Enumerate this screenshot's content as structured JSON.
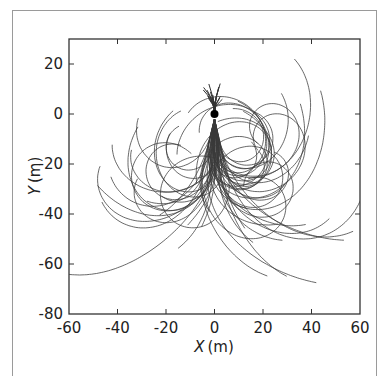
{
  "chart_data": {
    "type": "line",
    "title": "",
    "xlabel_var": "X",
    "xlabel_unit": "(m)",
    "ylabel_var": "Y",
    "ylabel_unit": "(m)",
    "xlim": [
      -60,
      60
    ],
    "ylim": [
      -80,
      30
    ],
    "xticks": [
      -60,
      -40,
      -20,
      0,
      20,
      40,
      60
    ],
    "yticks": [
      -80,
      -60,
      -40,
      -20,
      0,
      20
    ],
    "grid": false,
    "legend": null,
    "origin_marker": {
      "x": 0,
      "y": 0,
      "label": "start point"
    },
    "series_summary": {
      "count_estimate": 60,
      "x_range": [
        -42,
        48
      ],
      "y_range": [
        -52,
        12
      ],
      "line_color": "#3a3a3a"
    }
  }
}
